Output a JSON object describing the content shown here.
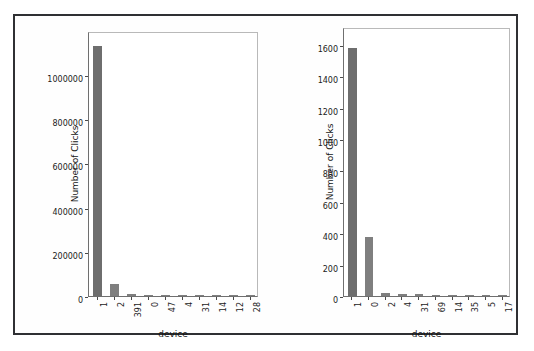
{
  "figure": {
    "border_color": "#2f3033",
    "bar_color": "#7f7f7f",
    "background": "#ffffff"
  },
  "chart_data": [
    {
      "id": "left",
      "type": "bar",
      "title": "",
      "xlabel": "device",
      "ylabel": "Number of Clicks",
      "categories": [
        "1",
        "2",
        "391",
        "0",
        "47",
        "4",
        "31",
        "14",
        "12",
        "28"
      ],
      "values": [
        1130000,
        55000,
        9000,
        2500,
        1200,
        700,
        500,
        400,
        300,
        200
      ],
      "ylim": [
        0,
        1190000
      ],
      "yticks": [
        0,
        200000,
        400000,
        600000,
        800000,
        1000000
      ],
      "ytick_labels": [
        "0",
        "200000",
        "400000",
        "600000",
        "800000",
        "1000000"
      ],
      "grid": false,
      "legend": null
    },
    {
      "id": "right",
      "type": "bar",
      "title": "",
      "xlabel": "device",
      "ylabel": "Number of Clicks",
      "categories": [
        "1",
        "0",
        "2",
        "4",
        "31",
        "69",
        "14",
        "35",
        "5",
        "17"
      ],
      "values": [
        1580,
        375,
        18,
        14,
        12,
        8,
        6,
        5,
        4,
        3
      ],
      "ylim": [
        0,
        1700
      ],
      "yticks": [
        0,
        200,
        400,
        600,
        800,
        1000,
        1200,
        1400,
        1600
      ],
      "ytick_labels": [
        "0",
        "200",
        "400",
        "600",
        "800",
        "1000",
        "1200",
        "1400",
        "1600"
      ],
      "grid": false,
      "legend": null
    }
  ]
}
